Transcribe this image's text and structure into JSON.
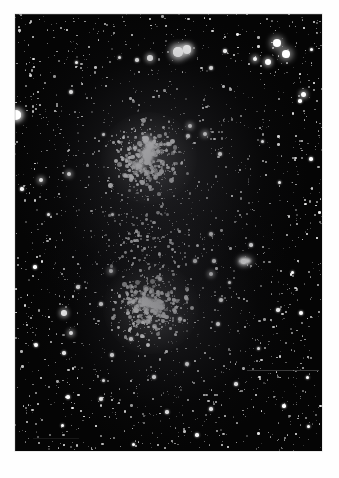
{
  "page": {
    "background_color": "#ffffff",
    "kind": "astronomical-photograph-plate"
  },
  "photo": {
    "title": "Open star cluster field (double cluster)",
    "frame": {
      "x": 15,
      "y": 14,
      "width": 307,
      "height": 437
    },
    "background_color": "#050505",
    "star_color": "#ffffff",
    "caption": ""
  },
  "features": [
    {
      "name": "upper-cluster",
      "cx": 133,
      "cy": 145,
      "label": "upper star cluster core"
    },
    {
      "name": "lower-cluster",
      "cx": 135,
      "cy": 293,
      "label": "lower star cluster core"
    },
    {
      "name": "bright-pair-top",
      "cx": 162,
      "cy": 38,
      "label": "bright double star near top"
    },
    {
      "name": "edge-star-left",
      "cx": 2,
      "cy": 101,
      "label": "bright star on left plate edge"
    },
    {
      "name": "elongated-blob-right",
      "cx": 228,
      "cy": 247,
      "label": "elongated bright object"
    },
    {
      "name": "plate-scratch",
      "cx": 270,
      "cy": 356,
      "label": "horizontal plate scratch"
    }
  ],
  "stars": {
    "bright": [
      [
        163,
        38,
        9.5
      ],
      [
        172,
        36,
        8.0
      ],
      [
        135,
        44,
        5.5
      ],
      [
        2,
        101,
        8.5
      ],
      [
        262,
        29,
        7.5
      ],
      [
        271,
        40,
        7.5
      ],
      [
        253,
        48,
        6.0
      ],
      [
        240,
        45,
        4.5
      ],
      [
        288,
        80,
        5.0
      ],
      [
        196,
        54,
        4.0
      ],
      [
        210,
        37,
        3.5
      ],
      [
        104,
        43,
        3.0
      ],
      [
        61,
        48,
        3.0
      ],
      [
        122,
        46,
        3.5
      ],
      [
        296,
        35,
        3.0
      ],
      [
        299,
        69,
        2.5
      ],
      [
        131,
        125,
        6.0
      ],
      [
        120,
        134,
        4.0
      ],
      [
        153,
        130,
        4.0
      ],
      [
        175,
        112,
        4.5
      ],
      [
        56,
        78,
        4.0
      ],
      [
        88,
        120,
        3.0
      ],
      [
        54,
        160,
        4.5
      ],
      [
        26,
        166,
        4.5
      ],
      [
        7,
        175,
        3.5
      ],
      [
        173,
        122,
        3.5
      ],
      [
        190,
        120,
        4.5
      ],
      [
        205,
        140,
        3.5
      ],
      [
        247,
        127,
        3.0
      ],
      [
        285,
        87,
        3.5
      ],
      [
        296,
        145,
        3.5
      ],
      [
        264,
        168,
        3.0
      ],
      [
        33,
        200,
        3.0
      ],
      [
        97,
        200,
        3.0
      ],
      [
        20,
        253,
        3.5
      ],
      [
        196,
        220,
        4.0
      ],
      [
        228,
        247,
        5.0
      ],
      [
        236,
        231,
        3.5
      ],
      [
        96,
        257,
        4.5
      ],
      [
        49,
        299,
        5.5
      ],
      [
        63,
        273,
        3.5
      ],
      [
        199,
        247,
        3.5
      ],
      [
        196,
        260,
        4.5
      ],
      [
        86,
        290,
        3.5
      ],
      [
        130,
        289,
        6.5
      ],
      [
        139,
        291,
        5.5
      ],
      [
        118,
        288,
        4.5
      ],
      [
        145,
        265,
        4.0
      ],
      [
        180,
        247,
        3.5
      ],
      [
        203,
        310,
        4.0
      ],
      [
        56,
        319,
        4.5
      ],
      [
        49,
        339,
        3.5
      ],
      [
        21,
        331,
        4.0
      ],
      [
        97,
        341,
        3.5
      ],
      [
        172,
        350,
        4.0
      ],
      [
        116,
        325,
        3.5
      ],
      [
        165,
        305,
        3.5
      ],
      [
        206,
        286,
        4.0
      ],
      [
        214,
        268,
        3.0
      ],
      [
        263,
        296,
        3.5
      ],
      [
        286,
        299,
        4.0
      ],
      [
        277,
        258,
        3.0
      ],
      [
        292,
        363,
        3.0
      ],
      [
        221,
        370,
        3.5
      ],
      [
        269,
        392,
        3.5
      ],
      [
        196,
        395,
        3.5
      ],
      [
        152,
        398,
        3.5
      ],
      [
        86,
        385,
        4.0
      ],
      [
        53,
        383,
        3.5
      ],
      [
        47,
        411,
        3.0
      ],
      [
        118,
        430,
        3.0
      ],
      [
        182,
        421,
        3.5
      ],
      [
        88,
        366,
        3.0
      ],
      [
        139,
        363,
        3.5
      ],
      [
        293,
        412,
        3.0
      ],
      [
        243,
        334,
        3.0
      ]
    ]
  }
}
